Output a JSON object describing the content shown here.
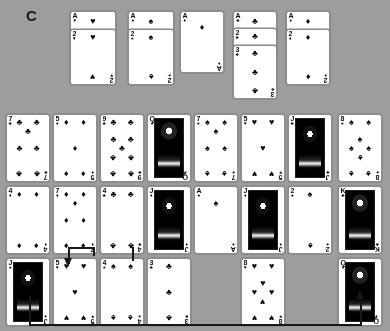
{
  "panel": {
    "label": "C"
  },
  "board": {
    "background_color": "#9d9d9d",
    "card_face_color": "#fbfbfb",
    "ink_color": "#111111"
  },
  "suits": {
    "hearts": "♥",
    "spades": "♠",
    "diamonds": "♦",
    "clubs": "♣"
  },
  "foundations": [
    {
      "name": "foundation-pile-1",
      "x": 70,
      "y": 11,
      "w": 46,
      "h": 74,
      "cards": [
        {
          "rank": "A",
          "suit": "hearts",
          "offset": 0
        },
        {
          "rank": "2",
          "suit": "hearts",
          "offset": 18
        }
      ]
    },
    {
      "name": "foundation-pile-2",
      "x": 128,
      "y": 11,
      "w": 46,
      "h": 74,
      "cards": [
        {
          "rank": "A",
          "suit": "spades",
          "offset": 0
        },
        {
          "rank": "2",
          "suit": "spades",
          "offset": 18
        }
      ]
    },
    {
      "name": "foundation-pile-3",
      "x": 180,
      "y": 11,
      "w": 44,
      "h": 62,
      "cards": [
        {
          "rank": "A",
          "suit": "diamonds",
          "offset": 0
        }
      ]
    },
    {
      "name": "foundation-pile-4",
      "x": 233,
      "y": 11,
      "w": 44,
      "h": 88,
      "cards": [
        {
          "rank": "A",
          "suit": "clubs",
          "offset": 0
        },
        {
          "rank": "2",
          "suit": "clubs",
          "offset": 17
        },
        {
          "rank": "3",
          "suit": "clubs",
          "offset": 34
        }
      ]
    },
    {
      "name": "foundation-pile-5",
      "x": 286,
      "y": 11,
      "w": 44,
      "h": 74,
      "cards": [
        {
          "rank": "A",
          "suit": "diamonds",
          "offset": 0
        },
        {
          "rank": "2",
          "suit": "diamonds",
          "offset": 18
        }
      ]
    }
  ],
  "tableau": {
    "columns": 8,
    "rows": [
      {
        "name": "tableau-row-1",
        "y": 114,
        "cards": [
          {
            "rank": "7",
            "suit": "clubs",
            "col": 0
          },
          {
            "rank": "5",
            "suit": "diamonds",
            "col": 1
          },
          {
            "rank": "9",
            "suit": "clubs",
            "col": 2
          },
          {
            "rank": "Q",
            "suit": "spades",
            "col": 3,
            "court": true
          },
          {
            "rank": "7",
            "suit": "spades",
            "col": 4
          },
          {
            "rank": "5",
            "suit": "hearts",
            "col": 5
          },
          {
            "rank": "J",
            "suit": "clubs",
            "col": 6,
            "court": true
          },
          {
            "rank": "8",
            "suit": "spades",
            "col": 7
          }
        ]
      },
      {
        "name": "tableau-row-2",
        "y": 186,
        "cards": [
          {
            "rank": "4",
            "suit": "diamonds",
            "col": 0
          },
          {
            "rank": "7",
            "suit": "diamonds",
            "col": 1
          },
          {
            "rank": "4",
            "suit": "clubs",
            "col": 2
          },
          {
            "rank": "J",
            "suit": "diamonds",
            "col": 3,
            "court": true
          },
          {
            "rank": "A",
            "suit": "spades",
            "col": 4
          },
          {
            "rank": "J",
            "suit": "diamonds",
            "col": 5,
            "court": true
          },
          {
            "rank": "2",
            "suit": "spades",
            "col": 6
          },
          {
            "rank": "K",
            "suit": "clubs",
            "col": 7,
            "court": true
          }
        ]
      },
      {
        "name": "tableau-row-3",
        "y": 258,
        "cards": [
          {
            "rank": "J",
            "suit": "spades",
            "col": 0,
            "court": true
          },
          {
            "rank": "5",
            "suit": "hearts",
            "col": 1
          },
          {
            "rank": "4",
            "suit": "spades",
            "col": 2
          },
          {
            "rank": "3",
            "suit": "clubs",
            "col": 3
          },
          {
            "rank": "8",
            "suit": "hearts",
            "col": 5
          },
          {
            "rank": "Q",
            "suit": "diamonds",
            "col": 7,
            "court": true
          }
        ]
      }
    ]
  },
  "annotations": [
    {
      "name": "move-arrow-queen-to-jack",
      "description": "line from queen-of-diamonds up-arrow to jack-of-spades",
      "color": "#1b1b1b"
    },
    {
      "name": "move-arrow-onto-five-of-hearts",
      "description": "downward arrow landing on five of hearts",
      "color": "#1b1b1b"
    }
  ]
}
